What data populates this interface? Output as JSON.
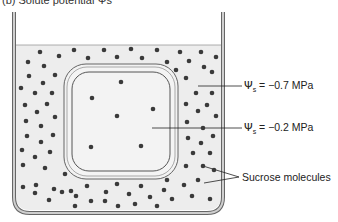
{
  "caption": "(b) Solute potential Ψs",
  "labels": {
    "outer": {
      "symbol": "Ψ",
      "sub": "s",
      "value": "= −0.7 MPa"
    },
    "inner": {
      "symbol": "Ψ",
      "sub": "s",
      "value": "= −0.2 MPa"
    },
    "molecules": "Sucrose molecules"
  },
  "colors": {
    "solution": "#ededed",
    "wall": "#c8c8c8",
    "outline": "#555555",
    "dot": "#3a3a3a"
  }
}
